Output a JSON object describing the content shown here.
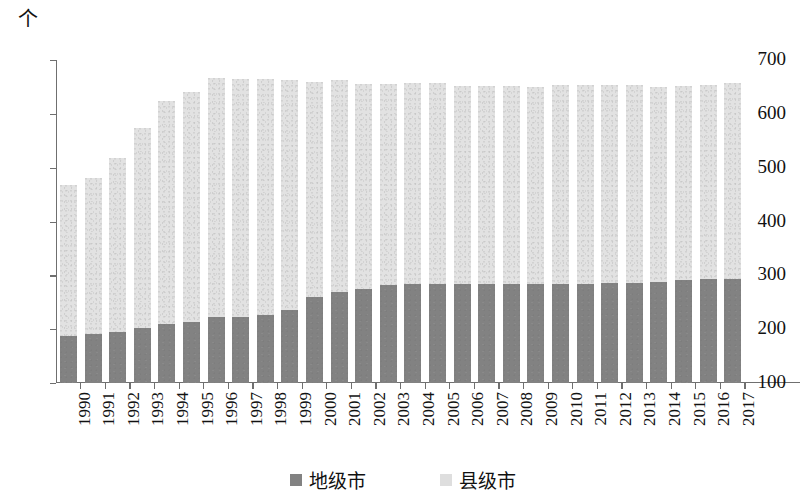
{
  "chart": {
    "unit_label": "个",
    "y_ticks": [
      100,
      200,
      300,
      400,
      500,
      600,
      700
    ],
    "legend": [
      {
        "key": "prefecture",
        "label": "地级市",
        "color": "#828282"
      },
      {
        "key": "county",
        "label": "县级市",
        "color": "#dedede"
      }
    ]
  },
  "chart_data": {
    "type": "bar",
    "title": "",
    "subtitle": "",
    "xlabel": "",
    "ylabel": "个",
    "ylim": [
      100,
      700
    ],
    "grid": false,
    "stacked": true,
    "legend_position": "bottom",
    "categories": [
      "1990",
      "1991",
      "1992",
      "1993",
      "1994",
      "1995",
      "1996",
      "1997",
      "1998",
      "1999",
      "2000",
      "2001",
      "2002",
      "2003",
      "2004",
      "2005",
      "2006",
      "2007",
      "2008",
      "2009",
      "2010",
      "2011",
      "2012",
      "2013",
      "2014",
      "2015",
      "2016",
      "2017"
    ],
    "series": [
      {
        "name": "地级市",
        "color": "#828282",
        "values": [
          188,
          191,
          195,
          202,
          210,
          214,
          222,
          222,
          227,
          236,
          259,
          269,
          275,
          282,
          283,
          283,
          283,
          283,
          283,
          283,
          283,
          284,
          285,
          286,
          288,
          291,
          293,
          294
        ]
      },
      {
        "name": "县级市",
        "color": "#dedede",
        "values": [
          279,
          289,
          323,
          371,
          413,
          427,
          445,
          442,
          437,
          427,
          400,
          393,
          381,
          374,
          374,
          374,
          369,
          368,
          368,
          367,
          370,
          369,
          368,
          368,
          361,
          361,
          360,
          363
        ]
      }
    ],
    "totals": [
      467,
      480,
      518,
      573,
      623,
      641,
      667,
      664,
      664,
      663,
      659,
      662,
      656,
      656,
      657,
      657,
      652,
      651,
      651,
      650,
      653,
      653,
      653,
      654,
      649,
      652,
      653,
      657
    ]
  }
}
